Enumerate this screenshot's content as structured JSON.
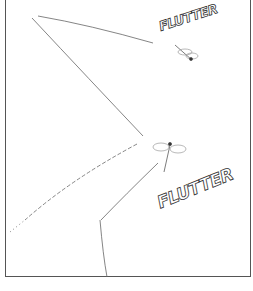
{
  "panel": {
    "sound_effects": [
      {
        "text": "FLUTTER",
        "position": "top-right"
      },
      {
        "text": "FLUTTER",
        "position": "middle-right"
      }
    ],
    "illustrations": [
      "dragonfly-small",
      "dragonfly-large"
    ],
    "colors": {
      "line": "#555555",
      "background": "#ffffff"
    }
  }
}
